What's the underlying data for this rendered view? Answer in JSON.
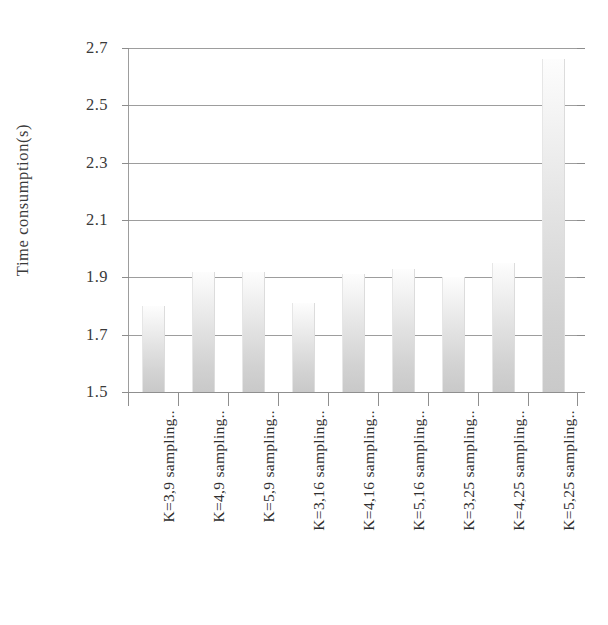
{
  "chart_data": {
    "type": "bar",
    "title": "",
    "xlabel": "",
    "ylabel": "Time consumption(s)",
    "ylim": [
      1.5,
      2.7
    ],
    "ytick_step": 0.2,
    "yticks": [
      "2.7",
      "2.5",
      "2.3",
      "2.1",
      "1.9",
      "1.7",
      "1.5"
    ],
    "ytick_values": [
      2.7,
      2.5,
      2.3,
      2.1,
      1.9,
      1.7,
      1.5
    ],
    "grid": "horizontal",
    "legend": "none",
    "bar_color": "#d8d8d8",
    "bar_gradient_top": "#fdfdfd",
    "bar_gradient_bottom": "#c9c9c9",
    "axis_color": "#8f8f8f",
    "text_color": "#2e2e2e",
    "categories": [
      "K=3,9 sampling..",
      "K=4,9 sampling..",
      "K=5,9 sampling..",
      "K=3,16 sampling..",
      "K=4,16 sampling..",
      "K=5,16 sampling..",
      "K=3,25 sampling..",
      "K=4,25 sampling..",
      "K=5,25 sampling.."
    ],
    "values": [
      1.8,
      1.92,
      1.92,
      1.81,
      1.91,
      1.93,
      1.9,
      1.95,
      2.66
    ]
  }
}
